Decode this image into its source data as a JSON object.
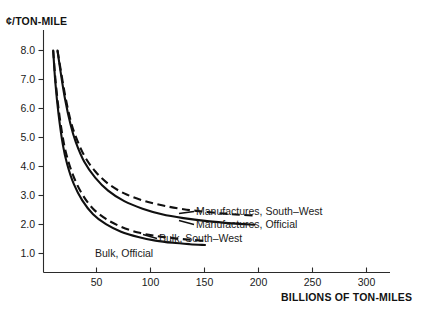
{
  "chart_data": {
    "type": "line",
    "title": "",
    "xlabel": "BILLIONS OF TON-MILES",
    "ylabel": "¢/TON-MILE",
    "xlim": [
      0,
      330
    ],
    "ylim": [
      0,
      8.6
    ],
    "grid": false,
    "legend_position": "inline-right-of-curve-ends",
    "xticks": [
      50,
      100,
      150,
      200,
      250,
      300
    ],
    "xtick_labels": [
      "50",
      "100",
      "150",
      "200",
      "250",
      "300"
    ],
    "yticks": [
      1.0,
      2.0,
      3.0,
      4.0,
      5.0,
      6.0,
      7.0,
      8.0
    ],
    "ytick_labels": [
      "1.0",
      "2.0",
      "3.0",
      "4.0",
      "5.0",
      "6.0",
      "7.0",
      "8.0"
    ],
    "series": [
      {
        "name": "Manufactures, South-West",
        "style": "dashed",
        "x": [
          13,
          16,
          20,
          25,
          30,
          38,
          48,
          60,
          75,
          92,
          110,
          130,
          152,
          175,
          196
        ],
        "y": [
          8.0,
          7.3,
          6.4,
          5.5,
          4.9,
          4.2,
          3.65,
          3.2,
          2.85,
          2.6,
          2.42,
          2.28,
          2.18,
          2.1,
          2.05
        ]
      },
      {
        "name": "Manufactures, Official",
        "style": "solid",
        "x": [
          13,
          16,
          20,
          25,
          30,
          38,
          48,
          60,
          75,
          92,
          110,
          130,
          152,
          175,
          196
        ],
        "y": [
          8.0,
          7.2,
          6.25,
          5.35,
          4.7,
          3.98,
          3.42,
          2.95,
          2.57,
          2.3,
          2.1,
          1.96,
          1.85,
          1.77,
          1.72
        ]
      },
      {
        "name": "Bulk, South-West",
        "style": "dashed",
        "x": [
          9,
          11,
          14,
          18,
          22,
          28,
          36,
          46,
          58,
          72,
          88,
          104,
          120,
          136,
          150
        ],
        "y": [
          8.0,
          7.0,
          5.9,
          4.85,
          4.15,
          3.45,
          2.82,
          2.3,
          1.93,
          1.65,
          1.44,
          1.32,
          1.24,
          1.18,
          1.14
        ]
      },
      {
        "name": "Bulk, Official",
        "style": "solid",
        "x": [
          9,
          11,
          14,
          18,
          22,
          28,
          36,
          46,
          58,
          72,
          88,
          104,
          120,
          136,
          150
        ],
        "y": [
          8.0,
          6.85,
          5.7,
          4.6,
          3.9,
          3.2,
          2.6,
          2.1,
          1.74,
          1.47,
          1.28,
          1.15,
          1.07,
          1.02,
          0.99
        ]
      }
    ],
    "annotations": [
      {
        "text": "Manufactures, South-West",
        "x_px": 197,
        "y_px": 215
      },
      {
        "text": "Manufactures, Official",
        "x_px": 197,
        "y_px": 228
      },
      {
        "text": "Bulk, South-West",
        "x_px": 160,
        "y_px": 241
      },
      {
        "text": "Bulk, Official",
        "x_px": 95,
        "y_px": 256
      }
    ],
    "colors": {
      "curve": "#101010",
      "axis": "#2b2b2b",
      "text": "#1a1a1a",
      "background": "#ffffff"
    }
  },
  "labels": {
    "y_axis_title": "¢/TON-MILE",
    "x_axis_title": "BILLIONS OF TON-MILES",
    "series_manufactures_sw": "Manufactures, South–West",
    "series_manufactures_official": "Manufactures, Official",
    "series_bulk_sw": "Bulk, South–West",
    "series_bulk_official": "Bulk, Official",
    "ytick_1": "1.0",
    "ytick_2": "2.0",
    "ytick_3": "3.0",
    "ytick_4": "4.0",
    "ytick_5": "5.0",
    "ytick_6": "6.0",
    "ytick_7": "7.0",
    "ytick_8": "8.0",
    "xtick_50": "50",
    "xtick_100": "100",
    "xtick_150": "150",
    "xtick_200": "200",
    "xtick_250": "250",
    "xtick_300": "300"
  }
}
